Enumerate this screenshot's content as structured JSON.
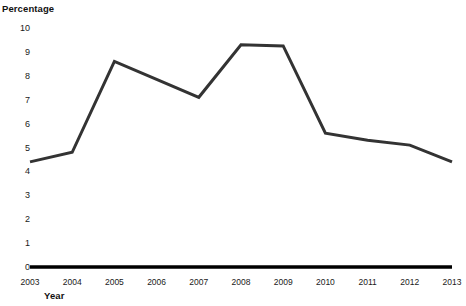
{
  "chart_data": {
    "type": "line",
    "title": "",
    "ylabel": "Percentage",
    "xlabel": "Year",
    "categories": [
      "2003",
      "2004",
      "2005",
      "2006",
      "2007",
      "2008",
      "2009",
      "2010",
      "2011",
      "2012",
      "2013"
    ],
    "x": [
      2003,
      2004,
      2005,
      2006,
      2007,
      2008,
      2009,
      2010,
      2011,
      2012,
      2013
    ],
    "values": [
      4.4,
      4.8,
      8.6,
      7.85,
      7.1,
      9.3,
      9.25,
      5.6,
      5.3,
      5.1,
      4.4
    ],
    "series": [
      {
        "name": "Percentage",
        "values": [
          4.4,
          4.8,
          8.6,
          7.85,
          7.1,
          9.3,
          9.25,
          5.6,
          5.3,
          5.1,
          4.4
        ]
      }
    ],
    "ylim": [
      0,
      10
    ],
    "yticks": [
      0,
      1,
      2,
      3,
      4,
      5,
      6,
      7,
      8,
      9,
      10
    ],
    "ytick_labels": [
      "0",
      "1",
      "2",
      "3",
      "4",
      "5",
      "6",
      "7",
      "8",
      "9",
      "10"
    ],
    "grid": false,
    "legend": false,
    "legend_position": "none",
    "line_color": "#333333",
    "baseline_color": "#000000",
    "text_color": "#1a1a1a"
  }
}
